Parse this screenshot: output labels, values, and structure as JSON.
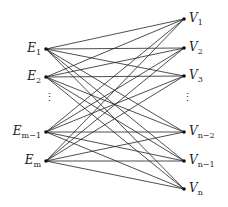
{
  "diagram": {
    "type": "complete bipartite graph",
    "left_nodes": [
      {
        "id": "E1",
        "base": "E",
        "sub": "1",
        "x": 46,
        "y": 49
      },
      {
        "id": "E2",
        "base": "E",
        "sub": "2",
        "x": 46,
        "y": 77
      },
      {
        "id": "Em-1",
        "base": "E",
        "sub": "m−1",
        "x": 46,
        "y": 132
      },
      {
        "id": "Em",
        "base": "E",
        "sub": "m",
        "x": 46,
        "y": 161
      }
    ],
    "right_nodes": [
      {
        "id": "V1",
        "base": "V",
        "sub": "1",
        "x": 184,
        "y": 19
      },
      {
        "id": "V2",
        "base": "V",
        "sub": "2",
        "x": 184,
        "y": 48
      },
      {
        "id": "V3",
        "base": "V",
        "sub": "3",
        "x": 184,
        "y": 76
      },
      {
        "id": "Vn-2",
        "base": "V",
        "sub": "n−2",
        "x": 184,
        "y": 132
      },
      {
        "id": "Vn-1",
        "base": "V",
        "sub": "n−1",
        "x": 184,
        "y": 161
      },
      {
        "id": "Vn",
        "base": "V",
        "sub": "n",
        "x": 184,
        "y": 189
      }
    ],
    "ellipsis_left": "⋮",
    "ellipsis_right": "⋮",
    "edge_color": "#222222",
    "node_color": "#111111"
  }
}
